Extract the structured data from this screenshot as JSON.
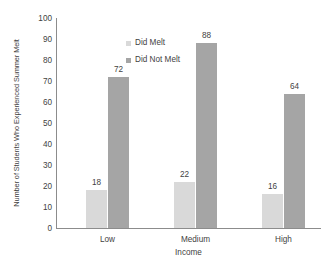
{
  "chart_data": {
    "type": "bar",
    "title": "",
    "xlabel": "Income",
    "ylabel": "Number of Students Who Experienced Summer Melt",
    "categories": [
      "Low",
      "Medium",
      "High"
    ],
    "series": [
      {
        "name": "Did Melt",
        "color": "#d9d9d9",
        "values": [
          18,
          22,
          16
        ]
      },
      {
        "name": "Did Not Melt",
        "color": "#a5a5a5",
        "values": [
          72,
          88,
          64
        ]
      }
    ],
    "ylim": [
      0,
      100
    ],
    "ytick_step": 10,
    "yticks": [
      "100",
      "90",
      "80",
      "70",
      "60",
      "50",
      "40",
      "30",
      "20",
      "10",
      "0"
    ],
    "data_labels": {
      "Low": {
        "Did Melt": "18",
        "Did Not Melt": "72"
      },
      "Medium": {
        "Did Melt": "22",
        "Did Not Melt": "88"
      },
      "High": {
        "Did Melt": "16",
        "Did Not Melt": "64"
      }
    },
    "grid": false,
    "legend_position": "top-left-inside",
    "axis_color": "#8c8c8c",
    "text_color": "#3f3f3f",
    "background": "#ffffff"
  },
  "legend": {
    "items": [
      {
        "label": "Did Melt",
        "color": "#d9d9d9"
      },
      {
        "label": "Did Not Melt",
        "color": "#a5a5a5"
      }
    ]
  }
}
